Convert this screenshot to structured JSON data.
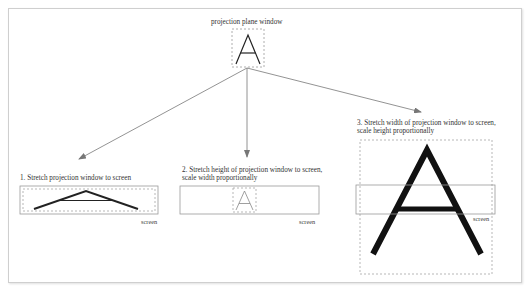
{
  "title": "projection plane window",
  "panels": [
    {
      "id": 1,
      "caption_line1": "1. Stretch projection window to screen",
      "caption_line2": "",
      "screen_label": "screen"
    },
    {
      "id": 2,
      "caption_line1": "2. Stretch height of projection window to screen,",
      "caption_line2": "scale width proportionally",
      "screen_label": "screen"
    },
    {
      "id": 3,
      "caption_line1": "3. Stretch width of projection window to screen,",
      "caption_line2": "scale height proportionally",
      "screen_label": "screen"
    }
  ],
  "colors": {
    "frame": "#cfcfcf",
    "screen_border": "#999999",
    "dashed": "#999999",
    "glyph": "#111111",
    "arrow": "#777777"
  }
}
